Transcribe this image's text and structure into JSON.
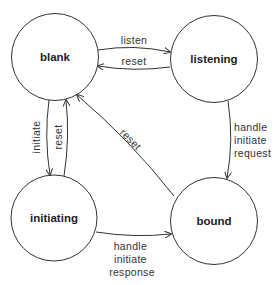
{
  "diagram": {
    "type": "state-machine",
    "colors": {
      "stroke": "#333333",
      "text": "#222222",
      "background": "#ffffff"
    },
    "states": [
      {
        "id": "blank",
        "label": "blank"
      },
      {
        "id": "listening",
        "label": "listening"
      },
      {
        "id": "initiating",
        "label": "initiating"
      },
      {
        "id": "bound",
        "label": "bound"
      }
    ],
    "transitions": [
      {
        "from": "blank",
        "to": "listening",
        "label": "listen"
      },
      {
        "from": "listening",
        "to": "blank",
        "label": "reset"
      },
      {
        "from": "blank",
        "to": "initiating",
        "label": "initiate"
      },
      {
        "from": "initiating",
        "to": "blank",
        "label": "reset"
      },
      {
        "from": "bound",
        "to": "blank",
        "label": "reset"
      },
      {
        "from": "listening",
        "to": "bound",
        "label_lines": [
          "handle",
          "initiate",
          "request"
        ]
      },
      {
        "from": "initiating",
        "to": "bound",
        "label_lines": [
          "handle",
          "initiate",
          "response"
        ]
      }
    ]
  }
}
